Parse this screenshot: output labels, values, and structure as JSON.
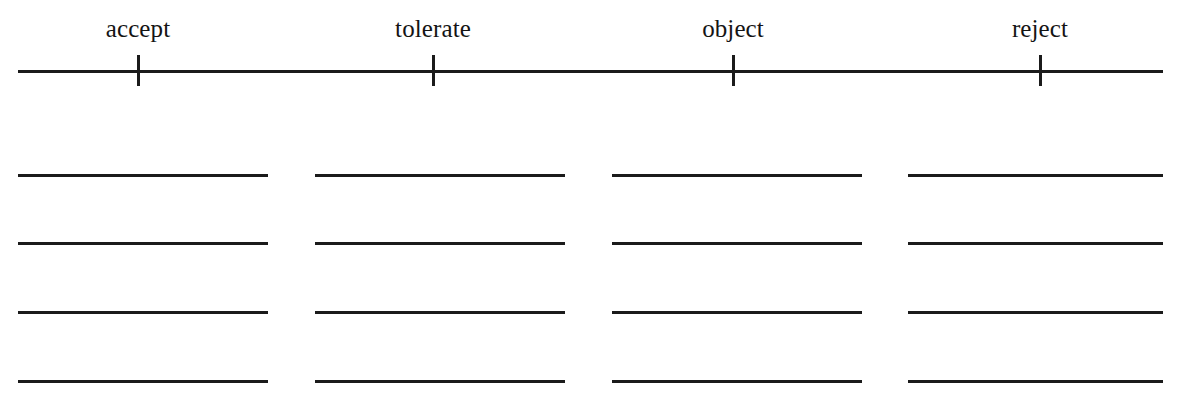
{
  "page": {
    "background_color": "#ffffff",
    "ink_color": "#1b1b1b",
    "width": 1183,
    "height": 412
  },
  "scale": {
    "name": "response-scale",
    "axis": {
      "start_x": 18,
      "end_x": 1163,
      "y": 70,
      "thickness": 3
    },
    "tick": {
      "top": 55,
      "height": 31,
      "thickness": 3
    },
    "label_y": 16,
    "points": [
      {
        "label": "accept",
        "x": 138
      },
      {
        "label": "tolerate",
        "x": 433
      },
      {
        "label": "object",
        "x": 733
      },
      {
        "label": "reject",
        "x": 1040
      }
    ]
  },
  "response_grid": {
    "name": "answer-lines",
    "columns": [
      {
        "label": "accept",
        "left": 18,
        "width": 250
      },
      {
        "label": "tolerate",
        "left": 315,
        "width": 250
      },
      {
        "label": "object",
        "left": 612,
        "width": 250
      },
      {
        "label": "reject",
        "left": 908,
        "width": 255
      }
    ],
    "row_y": [
      174,
      242,
      311,
      380
    ],
    "line_thickness": 3
  }
}
